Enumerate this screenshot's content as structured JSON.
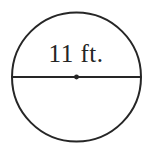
{
  "figure": {
    "name": "circle-with-diameter",
    "shape": "circle",
    "background_color": "#ffffff",
    "stroke_color": "#262626",
    "stroke_width_px": 2,
    "text_color": "#242424",
    "circle": {
      "center_x": 76.5,
      "center_y": 77,
      "radius": 64.5
    },
    "diameter_line": {
      "x1": 12,
      "y1": 77,
      "x2": 141,
      "y2": 77
    },
    "center_point": {
      "x": 76.5,
      "y": 77,
      "radius": 2.4
    },
    "label": {
      "text": "11 ft.",
      "value": 11,
      "unit": "ft.",
      "measures": "diameter",
      "position": "above-diameter-line"
    }
  }
}
